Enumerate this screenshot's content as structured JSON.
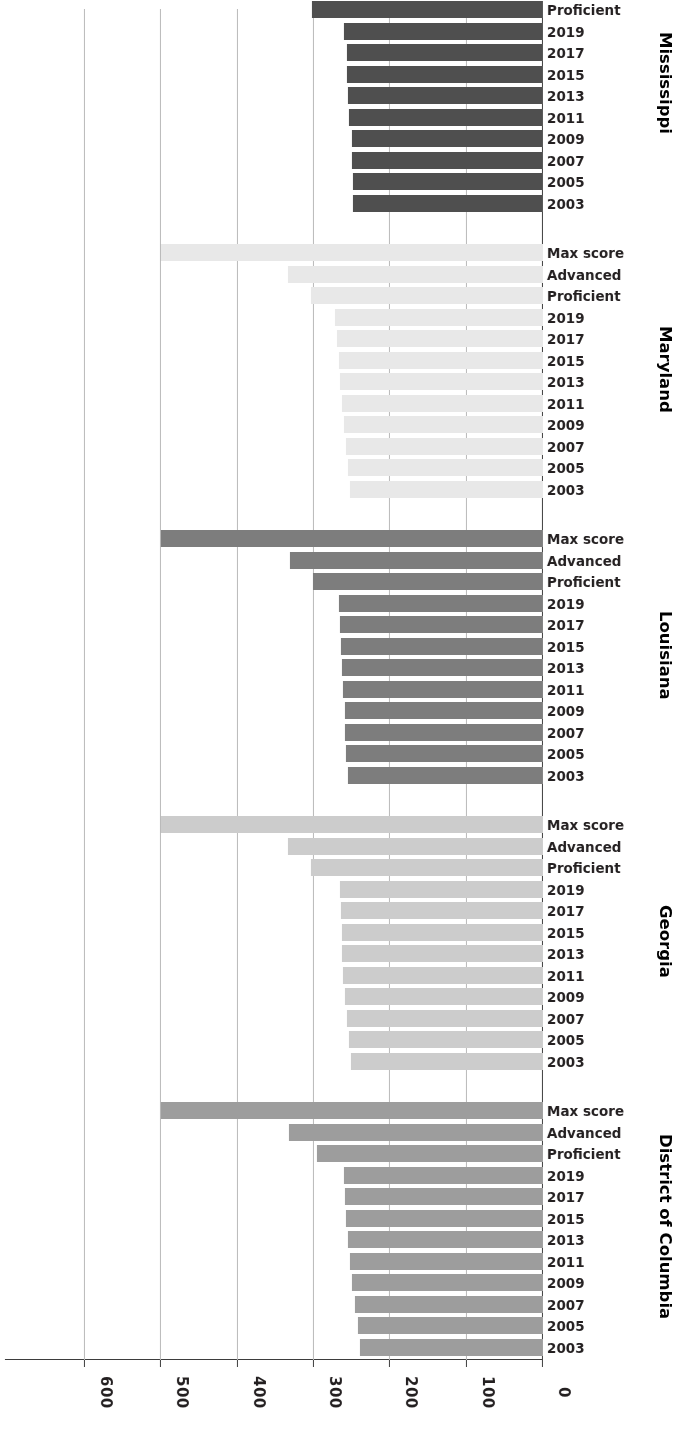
{
  "chart_data": {
    "type": "bar",
    "orientation": "horizontal",
    "title": "",
    "subtitle": "",
    "xlabel": "",
    "ylabel": "",
    "xlim": [
      0,
      640
    ],
    "grid": true,
    "grid_axis": "x",
    "legend": "none",
    "rotated_180": true,
    "xticks": [
      "0",
      "100",
      "200",
      "300",
      "400",
      "500",
      "600"
    ],
    "xtick_values": [
      0,
      100,
      200,
      300,
      400,
      500,
      600
    ],
    "categories": [
      "2003",
      "2005",
      "2007",
      "2009",
      "2011",
      "2013",
      "2015",
      "2017",
      "2019",
      "Proficient",
      "Advanced",
      "Max score"
    ],
    "groups": [
      {
        "name": "District of Columbia",
        "color": "#9d9d9d",
        "values": [
          240,
          243,
          246,
          250,
          253,
          256,
          258,
          259,
          261,
          296,
          333,
          500
        ]
      },
      {
        "name": "Georgia",
        "color": "#cccccc",
        "values": [
          252,
          254,
          257,
          260,
          262,
          263,
          264,
          265,
          266,
          304,
          334,
          500
        ]
      },
      {
        "name": "Louisiana",
        "color": "#7d7d7d",
        "values": [
          256,
          258,
          259,
          260,
          262,
          264,
          265,
          266,
          267,
          302,
          332,
          500
        ]
      },
      {
        "name": "Maryland",
        "color": "#e8e8e8",
        "values": [
          253,
          255,
          258,
          261,
          264,
          266,
          268,
          270,
          272,
          304,
          334,
          500
        ]
      },
      {
        "name": "Mississippi",
        "color": "#4f4f4f",
        "values": [
          249,
          249,
          250,
          250,
          254,
          255,
          257,
          257,
          261,
          303,
          335,
          500
        ]
      }
    ]
  }
}
